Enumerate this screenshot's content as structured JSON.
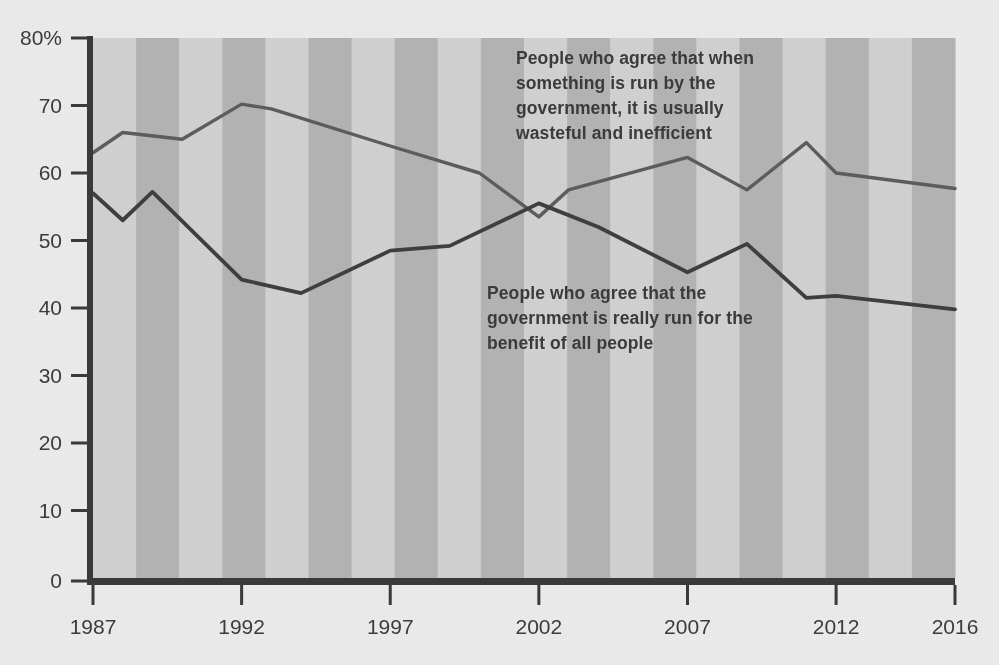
{
  "chart_data": {
    "type": "line",
    "title": "",
    "subtitle": "",
    "xlabel": "",
    "ylabel": "",
    "xlim": [
      1987,
      2016
    ],
    "ylim": [
      0,
      80
    ],
    "grid": false,
    "legend_position": "inline-annotations",
    "y_ticks": [
      "0",
      "10",
      "20",
      "30",
      "40",
      "50",
      "60",
      "70",
      "80%"
    ],
    "y_tick_values": [
      0,
      10,
      20,
      30,
      40,
      50,
      60,
      70,
      80
    ],
    "x_ticks": [
      "1987",
      "1992",
      "1997",
      "2002",
      "2007",
      "2012",
      "2016"
    ],
    "x_tick_values": [
      1987,
      1992,
      1997,
      2002,
      2007,
      2012,
      2016
    ],
    "series": [
      {
        "name": "People who agree that when something is run by the government, it is usually wasteful and inefficient",
        "color": "#5d5d5d",
        "x": [
          1987,
          1988,
          1990,
          1992,
          1993,
          1997,
          2000,
          2002,
          2003,
          2007,
          2009,
          2011,
          2012,
          2016
        ],
        "values": [
          63.0,
          66.0,
          65.0,
          70.2,
          69.5,
          64.0,
          60.0,
          53.5,
          57.5,
          62.3,
          57.5,
          64.5,
          60.0,
          57.7
        ]
      },
      {
        "name": "People who agree that the government is really run for the benefit of all people",
        "color": "#3f3f3f",
        "x": [
          1987,
          1988,
          1989,
          1992,
          1994,
          1997,
          1999,
          2002,
          2004,
          2007,
          2009,
          2011,
          2012,
          2016
        ],
        "values": [
          57.0,
          53.0,
          57.2,
          44.2,
          42.2,
          48.5,
          49.2,
          55.5,
          52.0,
          45.3,
          49.5,
          41.5,
          41.8,
          39.8
        ]
      }
    ],
    "annotations": [
      {
        "id": "wasteful",
        "text": "People who agree that when something is run by the government, it is usually wasteful and inefficient"
      },
      {
        "id": "benefit",
        "text": "People who agree that the government is really run for the benefit of all people"
      }
    ],
    "background": {
      "page": "#ececed",
      "band_light": "#d2d2d2",
      "band_dark": "#b4b4b4",
      "axis": "#3a3a3a"
    }
  }
}
